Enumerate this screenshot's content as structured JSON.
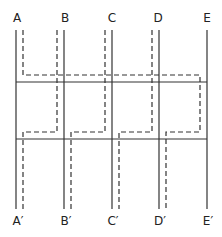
{
  "diagram": {
    "top_labels": [
      "A",
      "B",
      "C",
      "D",
      "E"
    ],
    "bottom_labels": [
      "A′",
      "B′",
      "C′",
      "D′",
      "E′"
    ],
    "colors": {
      "line": "#333333",
      "background": "#ffffff",
      "text": "#222222"
    },
    "solid_verticals_x": [
      16,
      64,
      112,
      159,
      207
    ],
    "solid_horizontals_y": [
      82,
      139
    ],
    "dashed_upper_y": 75,
    "dashed_lower_y": 132,
    "dashed_path_description": "Dashed route: A drops to upper dashed line and runs right to near E, dropping to lower dashed line and over to D'; B, C, D dashed lines descend to the lower dashed line then shift left to exit at A', B', C' respectively."
  }
}
